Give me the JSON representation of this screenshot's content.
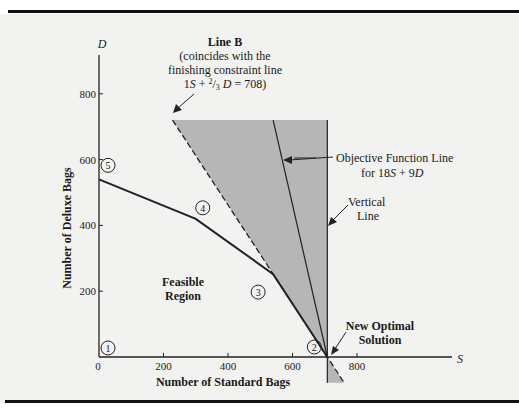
{
  "chart_data": {
    "type": "line",
    "title": "",
    "xlabel": "Number of Standard Bags",
    "ylabel": "Number of Deluxe Bags",
    "x_axis_var": "S",
    "y_axis_var": "D",
    "xlim": [
      0,
      950
    ],
    "ylim": [
      0,
      950
    ],
    "x_ticks": [
      0,
      200,
      400,
      600,
      800
    ],
    "y_ticks": [
      200,
      400,
      600,
      800
    ],
    "x_tick_labels": [
      "0",
      "200",
      "400",
      "600",
      "800"
    ],
    "y_tick_labels": [
      "200",
      "400",
      "600",
      "800"
    ],
    "grid": false,
    "feasible_region_boundary": {
      "name": "Feasible Region",
      "points": [
        {
          "S": 0,
          "D": 0,
          "label": "1"
        },
        {
          "S": 708,
          "D": 0,
          "label": "2"
        },
        {
          "S": 540,
          "D": 252,
          "label": "3"
        },
        {
          "S": 300,
          "D": 420,
          "label": "4"
        },
        {
          "S": 0,
          "D": 540,
          "label": "5"
        }
      ]
    },
    "series": [
      {
        "name": "Line B",
        "style": "dashed",
        "points": [
          {
            "S": 228,
            "D": 720
          },
          {
            "S": 760,
            "D": -78
          }
        ]
      },
      {
        "name": "Objective Function Line for 18S + 9D",
        "style": "solid",
        "points": [
          {
            "S": 540,
            "D": 720
          },
          {
            "S": 708,
            "D": 0
          }
        ]
      },
      {
        "name": "Vertical Line",
        "style": "solid",
        "points": [
          {
            "S": 708,
            "D": 720
          },
          {
            "S": 708,
            "D": -78
          }
        ]
      }
    ],
    "shaded_region": {
      "description": "Region between Line B and the vertical line",
      "color": "#b8b8b8",
      "points": [
        {
          "S": 228,
          "D": 720
        },
        {
          "S": 708,
          "D": 720
        },
        {
          "S": 708,
          "D": -78
        },
        {
          "S": 760,
          "D": -78
        }
      ]
    },
    "annotations": {
      "line_b_title": "Line B",
      "line_b_desc_1": "(coincides with the",
      "line_b_desc_2": "finishing constraint line",
      "line_b_eq_a": "1",
      "line_b_eq_b": "S",
      "line_b_eq_c": " + ",
      "line_b_eq_d": "2",
      "line_b_eq_e": "/",
      "line_b_eq_f": "3",
      "line_b_eq_g": " D",
      "line_b_eq_h": " = 708)",
      "objective_1": "Objective Function Line",
      "objective_2a": "for 18",
      "objective_2b": "S",
      "objective_2c": " + 9",
      "objective_2d": "D",
      "vertical_1": "Vertical",
      "vertical_2": "Line",
      "feasible_1": "Feasible",
      "feasible_2": "Region",
      "optimal_1": "New Optimal",
      "optimal_2": "Solution"
    }
  }
}
